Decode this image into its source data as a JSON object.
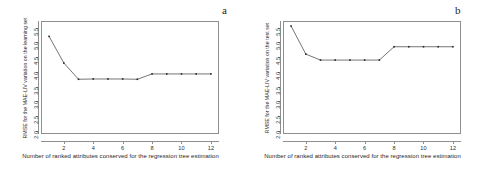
{
  "figure": {
    "width": 483,
    "height": 171,
    "background": "#ffffff",
    "line_color": "#3a3a3a",
    "axis_color": "#8f8f8f"
  },
  "panels": [
    {
      "tag": "a",
      "chart_data": {
        "type": "line",
        "title": "",
        "xlabel": "Number of ranked attributes conserved for the regression tree estimation",
        "ylabel": "RMSE for the MAE-LIV variation on the learning set",
        "x": [
          1,
          2,
          3,
          4,
          5,
          6,
          7,
          8,
          9,
          10,
          11,
          12
        ],
        "values": [
          5.2,
          4.3,
          3.75,
          3.76,
          3.76,
          3.76,
          3.75,
          3.93,
          3.93,
          3.93,
          3.93,
          3.93
        ],
        "xticks": [
          2,
          4,
          6,
          8,
          10,
          12
        ],
        "yticks": [
          2.0,
          2.5,
          3.0,
          3.5,
          4.0,
          4.5,
          5.0,
          5.5
        ],
        "xlim": [
          0.45,
          12.55
        ],
        "ylim": [
          1.9,
          5.72
        ],
        "grid": false,
        "legend": "none",
        "markers": true
      }
    },
    {
      "tag": "b",
      "chart_data": {
        "type": "line",
        "title": "",
        "xlabel": "Number of ranked attributes conserved for the regression tree estimation",
        "ylabel": "RMSE for the MAE-LIV variation on the test set",
        "x": [
          1,
          2,
          3,
          4,
          5,
          6,
          7,
          8,
          9,
          10,
          11,
          12
        ],
        "values": [
          5.55,
          4.6,
          4.4,
          4.4,
          4.4,
          4.4,
          4.4,
          4.85,
          4.85,
          4.85,
          4.85,
          4.85
        ],
        "xticks": [
          2,
          4,
          6,
          8,
          10,
          12
        ],
        "yticks": [
          2.0,
          2.5,
          3.0,
          3.5,
          4.0,
          4.5,
          5.0,
          5.5
        ],
        "xlim": [
          0.45,
          12.55
        ],
        "ylim": [
          1.9,
          5.72
        ],
        "grid": false,
        "legend": "none",
        "markers": true
      }
    }
  ]
}
